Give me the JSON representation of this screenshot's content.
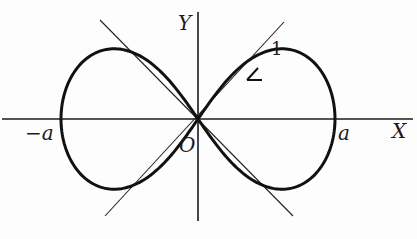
{
  "figure": {
    "type": "lemniscate",
    "equation_hint": "Lemniscate of Bernoulli with half-width a",
    "labels": {
      "y_axis": "Y",
      "x_axis": "X",
      "origin": "O",
      "neg_a": "−a",
      "pos_a": "a",
      "branch": "1"
    },
    "geometry": {
      "origin_px": [
        198,
        119
      ],
      "a_px": 137,
      "tangent_slopes": [
        1,
        -1
      ]
    },
    "colors": {
      "curve": "#111111",
      "axes": "#1a1a1a",
      "tangents": "#222222",
      "background": "#fdfdfd"
    }
  }
}
